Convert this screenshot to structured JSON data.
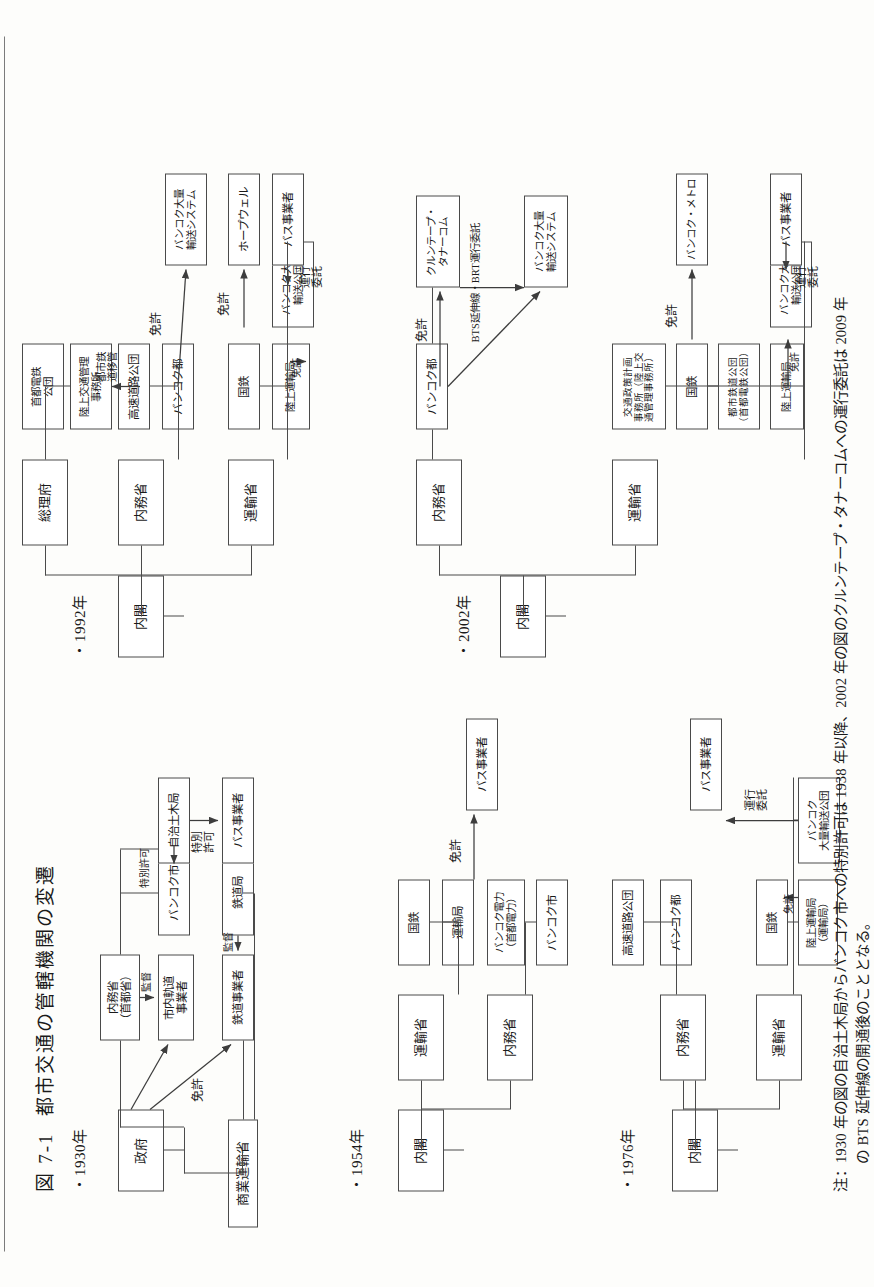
{
  "figure": {
    "number": "図 7-1",
    "title": "都市交通の管轄機関の変遷"
  },
  "sections": [
    {
      "id": "y1930",
      "year_label": "・1930年"
    },
    {
      "id": "y1954",
      "year_label": "・1954年"
    },
    {
      "id": "y1976",
      "year_label": "・1976年"
    },
    {
      "id": "y1992",
      "year_label": "・1992年"
    },
    {
      "id": "y2002",
      "year_label": "・2002年"
    }
  ],
  "charts": {
    "y1930": {
      "boxes": {
        "government": "政府",
        "commerce_transport_ministry": "商業運輸省",
        "interior_ministry": "内務省\n（首都省）",
        "city_tram_operator": "市内軌道\n事業者",
        "railway_operator": "鉄道事業者",
        "bangkok_city": "バンコク市",
        "railway_bureau": "鉄道局",
        "local_public_works_bureau": "自治土木局",
        "bus_operator": "バス事業者"
      },
      "annotations": {
        "license": "免許",
        "supervise_tram": "監督",
        "supervise_rail": "監督",
        "special_permit_city": "特別許可",
        "special_permit_bus": "特別\n許可"
      }
    },
    "y1954": {
      "boxes": {
        "cabinet": "内閣",
        "transport_ministry": "運輸省",
        "interior_ministry": "内務省",
        "national_railway": "国鉄",
        "bangkok_electric": "バンコク電力\n（首都電力）",
        "transport_bureau": "運輸局",
        "bangkok_city": "バンコク市",
        "bus_operator": "バス事業者"
      },
      "annotations": {
        "license": "免許"
      }
    },
    "y1976": {
      "boxes": {
        "cabinet": "内閣",
        "transport_ministry": "運輸省",
        "interior_ministry": "内務省",
        "national_railway": "国鉄",
        "expressway_authority": "高速道路公団",
        "land_transport_bureau": "陸上運輸局\n（運輸局）",
        "bangkok_metro_admin": "バンコク都",
        "bangkok_mass_transit_authority": "バンコク\n大量輸送公団",
        "bus_operator": "バス事業者"
      },
      "annotations": {
        "license": "免許",
        "operation_entrust": "運行\n委託"
      }
    },
    "y1992": {
      "boxes": {
        "cabinet": "内閣",
        "transport_ministry": "運輸省",
        "interior_ministry": "内務省",
        "prime_minister_office": "総理府",
        "national_railway": "国鉄",
        "expressway_authority": "高速道路公団",
        "metropolitan_rapid_transit_authority": "首都電鉄\n公団",
        "land_transport_bureau": "陸上運輸局",
        "bangkok_metro_admin": "バンコク都",
        "land_traffic_office": "陸上交通管理\n事務所",
        "hopewell": "ホープウェル",
        "bangkok_mass_transit_system": "バンコク大量\n輸送システム",
        "bangkok_mass_transit_authority": "バンコク大量\n輸送公団",
        "bus_operator": "バス事業者"
      },
      "annotations": {
        "license_hopewell": "免許",
        "license_bmts": "免許",
        "license_bmta": "免許",
        "license_bangkok": "免許",
        "urban_rail_transfer": "都市鉄\n道移管",
        "operation_entrust": "運行\n委託"
      }
    },
    "y2002": {
      "boxes": {
        "cabinet": "内閣",
        "transport_ministry": "運輸省",
        "interior_ministry": "内務省",
        "traffic_policy_office": "交通政策計画\n事務所（陸上交\n通管理事務所）",
        "national_railway": "国鉄",
        "urban_railway_authority": "都市鉄道公団\n（首都電鉄公団）",
        "land_transport_bureau": "陸上運輸局",
        "bangkok_mass_transit_authority": "バンコク大量\n輸送公団",
        "bangkok_metro_admin": "バンコク都",
        "bangkok_mass_transit_system": "バンコク大量\n輸送システム",
        "krungthep_thanakom": "クルンテープ・\nタナーコム",
        "bangkok_metro": "バンコク・メトロ",
        "bus_operator": "バス事業者"
      },
      "annotations": {
        "license_bmts": "免許",
        "license_metro": "免許",
        "license_bmta": "免許",
        "bts_brt_entrust": "BTS延伸線・BRT運行委託",
        "operation_entrust": "運行\n委託"
      }
    }
  },
  "note": {
    "line1": "注：1930 年の図の自治土木局からバンコク市への特別許可は 1938 年以降、2002 年の図のクルンテープ・タナーコムへの運行委託は 2009 年",
    "line2": "の BTS 延伸線の開通後のこととなる。"
  }
}
